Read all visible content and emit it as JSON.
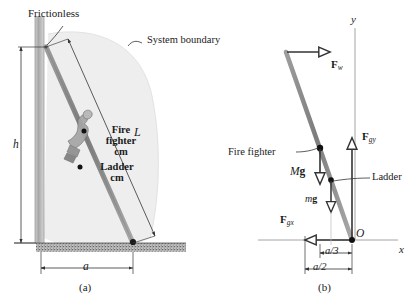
{
  "figure": {
    "panels": [
      {
        "caption": "(a)",
        "name": "physical-setup"
      },
      {
        "caption": "(b)",
        "name": "free-body-diagram"
      }
    ]
  },
  "panel_a": {
    "caption": "(a)",
    "labels": {
      "frictionless": "Frictionless",
      "system_boundary": "System boundary",
      "ladder_length": "L",
      "firefighter_line1": "Fire",
      "firefighter_line2": "fighter",
      "firefighter_line3": "cm",
      "ladder_line1": "Ladder",
      "ladder_line2": "cm",
      "height_dim": "h",
      "base_dim": "a"
    },
    "colors": {
      "wall": "#b0b0b0",
      "ladder": "#8c8c8c",
      "boundary_fill": "#ececec",
      "ground": "#8a8a8a",
      "line": "#333333"
    }
  },
  "panel_b": {
    "caption": "(b)",
    "labels": {
      "force_wall": "F",
      "force_wall_sub": "w",
      "force_ground_y": "F",
      "force_ground_y_sub": "gy",
      "force_ground_x": "F",
      "force_ground_x_sub": "gx",
      "weight_firefighter": "Mg",
      "weight_firefighter_bold": "g",
      "weight_firefighter_italic": "M",
      "weight_ladder_italic": "m",
      "weight_ladder_bold": "g",
      "firefighter_callout": "Fire fighter",
      "ladder_callout": "Ladder",
      "origin": "O",
      "axis_x": "x",
      "axis_y": "y",
      "dim_a_over_3": "a/3",
      "dim_a_over_2": "a/2"
    },
    "colors": {
      "ladder": "#8c8c8c",
      "axis": "#999999",
      "vector": "#333333",
      "line": "#333333"
    }
  }
}
